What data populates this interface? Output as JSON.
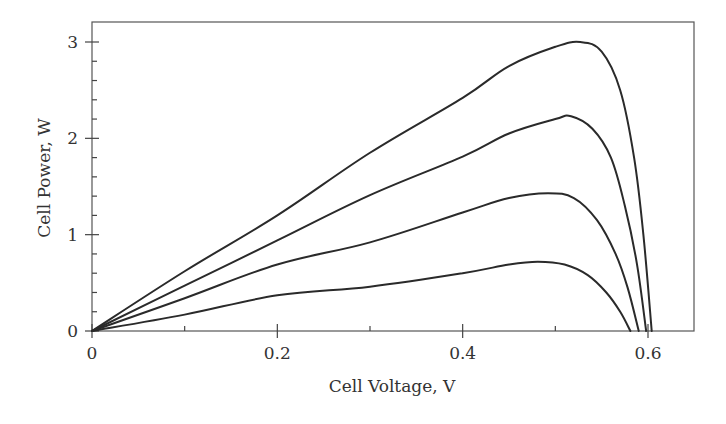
{
  "chart_data": {
    "type": "line",
    "title": "",
    "xlabel": "Cell Voltage, V",
    "ylabel": "Cell Power, W",
    "xlim": [
      0,
      0.65
    ],
    "ylim": [
      0,
      3.2
    ],
    "x_ticks": [
      0,
      0.2,
      0.4,
      0.6
    ],
    "x_tick_labels": [
      "0",
      "0.2",
      "0.4",
      "0.6"
    ],
    "x_minor_ticks": [
      0.1,
      0.3,
      0.5
    ],
    "y_ticks": [
      0,
      1,
      2,
      3
    ],
    "y_tick_labels": [
      "0",
      "1",
      "2",
      "3"
    ],
    "y_minor_ticks": [
      0.2,
      0.4,
      0.6,
      0.8,
      1.2,
      1.4,
      1.6,
      1.8,
      2.2,
      2.4,
      2.6,
      2.8
    ],
    "grid": false,
    "legend": null,
    "series": [
      {
        "name": "curve-1 (highest irradiance)",
        "x": [
          0,
          0.1,
          0.2,
          0.3,
          0.4,
          0.45,
          0.5,
          0.527,
          0.55,
          0.57,
          0.585,
          0.595,
          0.604
        ],
        "y": [
          0,
          0.62,
          1.2,
          1.85,
          2.42,
          2.75,
          2.95,
          3.0,
          2.9,
          2.5,
          1.8,
          1.0,
          0
        ]
      },
      {
        "name": "curve-2",
        "x": [
          0,
          0.1,
          0.2,
          0.3,
          0.4,
          0.45,
          0.5,
          0.517,
          0.54,
          0.56,
          0.575,
          0.588,
          0.598
        ],
        "y": [
          0,
          0.47,
          0.94,
          1.41,
          1.81,
          2.05,
          2.2,
          2.23,
          2.1,
          1.8,
          1.3,
          0.7,
          0
        ]
      },
      {
        "name": "curve-3",
        "x": [
          0,
          0.1,
          0.2,
          0.3,
          0.4,
          0.45,
          0.492,
          0.52,
          0.545,
          0.565,
          0.578,
          0.59
        ],
        "y": [
          0,
          0.34,
          0.69,
          0.92,
          1.23,
          1.38,
          1.43,
          1.38,
          1.15,
          0.8,
          0.45,
          0
        ]
      },
      {
        "name": "curve-4 (lowest irradiance)",
        "x": [
          0,
          0.1,
          0.2,
          0.3,
          0.4,
          0.45,
          0.481,
          0.51,
          0.535,
          0.555,
          0.57,
          0.581
        ],
        "y": [
          0,
          0.17,
          0.37,
          0.46,
          0.6,
          0.69,
          0.72,
          0.69,
          0.58,
          0.4,
          0.2,
          0
        ]
      }
    ]
  }
}
